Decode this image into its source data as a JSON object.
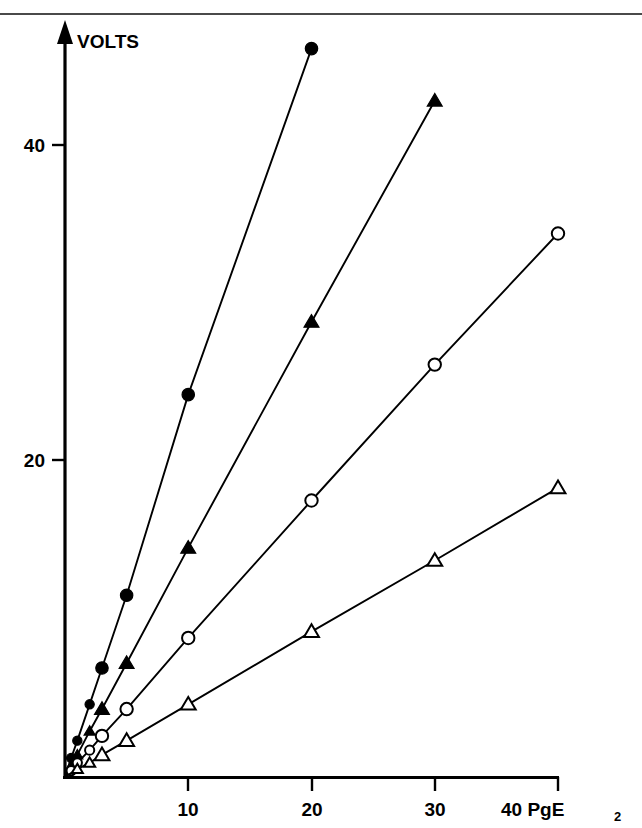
{
  "figure": {
    "background_color": "#ffffff",
    "rule_color": "#4a4a4a",
    "ink_color": "#000000"
  },
  "axes": {
    "y_title": "VOLTS",
    "x_title_main": "40 PgE",
    "x_title_sub": "2",
    "x_tick_labels": [
      "10",
      "20",
      "30",
      "40"
    ],
    "y_tick_labels": [
      "20",
      "40"
    ]
  },
  "chart_data": {
    "type": "line",
    "title": "",
    "subtitle": "",
    "xlabel": "PgE2",
    "ylabel": "VOLTS",
    "xlim": [
      0,
      40
    ],
    "ylim": [
      0,
      50
    ],
    "xticks": [
      10,
      20,
      30,
      40
    ],
    "yticks": [
      20,
      40
    ],
    "grid": false,
    "legend": "none",
    "axis_style": "open-arrow-y",
    "series": [
      {
        "name": "filled-circle",
        "marker": "filled-circle",
        "slope_volts_per_pg": 2.3,
        "x": [
          0,
          0.5,
          1,
          2,
          3,
          5,
          10,
          20
        ],
        "y": [
          0,
          1.2,
          2.3,
          4.6,
          6.9,
          11.5,
          24.2,
          46.1
        ]
      },
      {
        "name": "filled-triangle",
        "marker": "filled-triangle",
        "slope_volts_per_pg": 1.43,
        "x": [
          0,
          0.5,
          1,
          2,
          3,
          5,
          10,
          20,
          30
        ],
        "y": [
          0,
          0.7,
          1.4,
          2.9,
          4.3,
          7.2,
          14.5,
          28.8,
          42.8
        ]
      },
      {
        "name": "open-circle",
        "marker": "open-circle",
        "slope_volts_per_pg": 0.865,
        "x": [
          0,
          0.5,
          1,
          2,
          3,
          5,
          10,
          20,
          30,
          40
        ],
        "y": [
          0,
          0.4,
          0.9,
          1.7,
          2.6,
          4.3,
          8.8,
          17.5,
          26.1,
          34.4
        ]
      },
      {
        "name": "open-triangle",
        "marker": "open-triangle",
        "slope_volts_per_pg": 0.458,
        "x": [
          0,
          1,
          2,
          3,
          5,
          10,
          20,
          30,
          40
        ],
        "y": [
          0,
          0.5,
          0.9,
          1.4,
          2.3,
          4.6,
          9.2,
          13.7,
          18.3
        ]
      }
    ]
  }
}
